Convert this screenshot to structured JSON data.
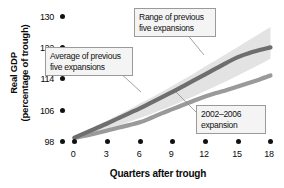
{
  "chart_data": {
    "type": "area",
    "title": "",
    "subtitle": "",
    "xlabel": "Quarters after trough",
    "ylabel": "Real GDP\n(percentage of trough)",
    "xlim": [
      0,
      18
    ],
    "ylim": [
      98,
      130
    ],
    "xticks": [
      0,
      3,
      6,
      9,
      12,
      15,
      18
    ],
    "yticks": [
      98,
      106,
      114,
      122,
      130
    ],
    "grid": false,
    "legend_position": "annotations",
    "x": [
      0,
      1,
      2,
      3,
      4,
      5,
      6,
      7,
      8,
      9,
      10,
      11,
      12,
      13,
      14,
      15,
      16,
      17,
      18
    ],
    "series": [
      {
        "name": "Range of previous five expansions (upper bound)",
        "color": "#e0e0e0",
        "values": [
          99.3,
          100.7,
          102.0,
          103.4,
          104.8,
          106.2,
          107.7,
          109.2,
          110.7,
          112.3,
          113.9,
          115.5,
          117.2,
          118.8,
          120.5,
          122.2,
          123.9,
          125.6,
          127.3
        ]
      },
      {
        "name": "Range of previous five expansions (lower bound)",
        "color": "#e0e0e0",
        "values": [
          98.8,
          99.6,
          100.4,
          101.2,
          102.1,
          103.0,
          104.0,
          105.0,
          106.1,
          107.2,
          108.4,
          109.6,
          110.9,
          112.2,
          113.5,
          114.9,
          116.3,
          117.7,
          119.2
        ]
      },
      {
        "name": "Average of previous five expansions",
        "color": "#6e6e6e",
        "values": [
          99.0,
          100.2,
          101.4,
          102.6,
          103.9,
          105.2,
          106.5,
          107.9,
          109.3,
          110.7,
          112.2,
          113.7,
          115.2,
          116.7,
          118.2,
          119.6,
          120.6,
          121.4,
          122.1
        ]
      },
      {
        "name": "2002-2006 expansion",
        "color": "#9a9a9a",
        "values": [
          98.9,
          99.5,
          100.1,
          100.8,
          101.5,
          102.2,
          102.9,
          104.0,
          105.2,
          106.3,
          107.4,
          108.5,
          109.5,
          110.4,
          111.2,
          112.1,
          113.0,
          113.9,
          114.9
        ]
      }
    ],
    "annotations": [
      {
        "id": "range",
        "text": "Range of previous\nfive expansions"
      },
      {
        "id": "average",
        "text": "Average of previous\nfive expansions"
      },
      {
        "id": "expansion",
        "text": "2002–2006\nexpansion"
      }
    ],
    "colors": {
      "band": "#e2e2e2",
      "average_line": "#6e6e6e",
      "expansion_line": "#9a9a9a",
      "tick_dot": "#111111",
      "callout_bg": "#f4f4f4",
      "callout_border": "#9a9a9a",
      "leader_line": "#8a8a8a"
    }
  }
}
